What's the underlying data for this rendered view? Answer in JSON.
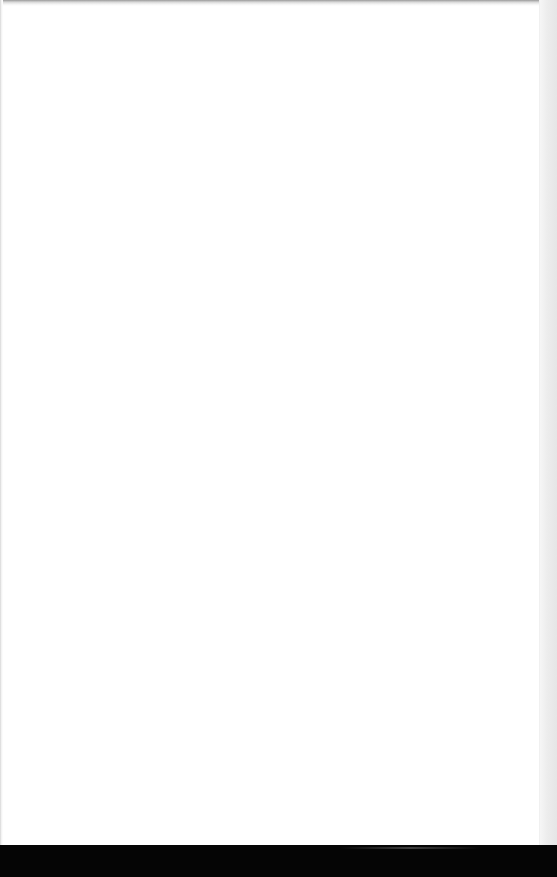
{
  "document": {
    "type": "blank-page",
    "text": "",
    "colors": {
      "page": "#ffffff",
      "right_margin": "#ebebeb",
      "bottom_bar": "#050505",
      "top_edge": "#9a9a9a"
    }
  }
}
